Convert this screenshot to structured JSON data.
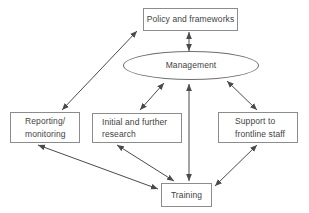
{
  "diagram": {
    "type": "flow-diagram",
    "background_color": "#ffffff",
    "line_color": "#4a4a4a",
    "box_border_color": "#8c8c8c",
    "text_color": "#3f3f3f",
    "nodes": {
      "policy": {
        "shape": "rectangle",
        "label": "Policy and frameworks"
      },
      "management": {
        "shape": "ellipse",
        "label": "Management"
      },
      "reporting": {
        "shape": "rectangle",
        "lines": [
          "Reporting/",
          "monitoring"
        ]
      },
      "research": {
        "shape": "rectangle",
        "lines": [
          "Initial and further",
          "research"
        ]
      },
      "support": {
        "shape": "rectangle",
        "lines": [
          "Support to",
          "frontline staff"
        ]
      },
      "training": {
        "shape": "rectangle",
        "label": "Training"
      }
    },
    "edges": [
      {
        "from": "reporting",
        "to": "policy",
        "type": "bidirectional-arrow"
      },
      {
        "from": "policy",
        "to": "management",
        "type": "bidirectional-arrow"
      },
      {
        "from": "management",
        "to": "research",
        "type": "bidirectional-arrow"
      },
      {
        "from": "management",
        "to": "support",
        "type": "bidirectional-arrow"
      },
      {
        "from": "management",
        "to": "training",
        "type": "bidirectional-arrow"
      },
      {
        "from": "reporting",
        "to": "training",
        "type": "bidirectional-arrow"
      },
      {
        "from": "research",
        "to": "training",
        "type": "bidirectional-arrow"
      },
      {
        "from": "support",
        "to": "training",
        "type": "bidirectional-arrow"
      }
    ]
  }
}
